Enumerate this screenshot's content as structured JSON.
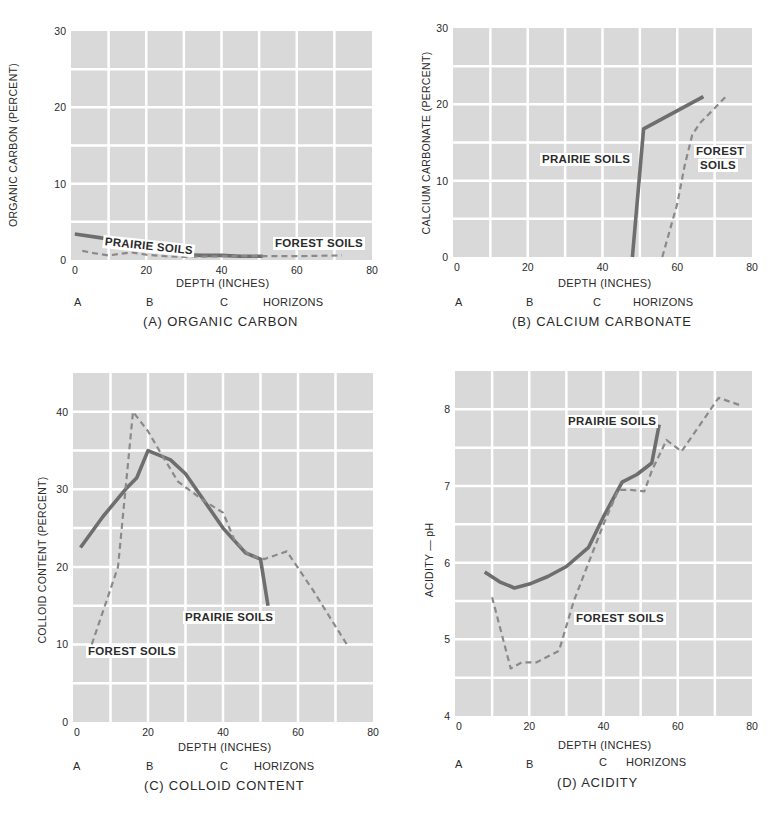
{
  "chart_data": [
    {
      "id": "A",
      "type": "line",
      "title": "(A) ORGANIC CARBON",
      "xlabel": "DEPTH  (INCHES)",
      "ylabel": "ORGANIC CARBON (PERCENT)",
      "xlim": [
        0,
        80
      ],
      "ylim": [
        0,
        30
      ],
      "xticks": [
        0,
        20,
        40,
        60,
        80
      ],
      "yticks": [
        0,
        10,
        20,
        30
      ],
      "grid": true,
      "horizons": [
        "A",
        "B",
        "C",
        "HORIZONS"
      ],
      "series": [
        {
          "name": "PRAIRIE SOILS",
          "style": "solid",
          "x": [
            1,
            8,
            15,
            17,
            20,
            25,
            30,
            35,
            40,
            45,
            50,
            51
          ],
          "y": [
            3.4,
            2.9,
            2.5,
            2.2,
            1.6,
            1.1,
            0.7,
            0.6,
            0.6,
            0.5,
            0.5,
            0.5
          ]
        },
        {
          "name": "FOREST SOILS",
          "style": "dashed",
          "x": [
            3,
            6,
            10,
            13,
            16,
            20,
            25,
            30,
            40,
            50,
            60,
            72
          ],
          "y": [
            1.2,
            0.9,
            0.6,
            0.8,
            1.0,
            0.7,
            0.5,
            0.4,
            0.5,
            0.5,
            0.5,
            0.6
          ]
        }
      ],
      "labels": [
        {
          "text": "PRAIRIE SOILS",
          "series": "PRAIRIE SOILS"
        },
        {
          "text": "FOREST SOILS",
          "series": "FOREST SOILS"
        }
      ]
    },
    {
      "id": "B",
      "type": "line",
      "title": "(B) CALCIUM CARBONATE",
      "xlabel": "DEPTH  (INCHES)",
      "ylabel": "CALCIUM CARBONATE (PERCENT)",
      "xlim": [
        0,
        80
      ],
      "ylim": [
        0,
        30
      ],
      "xticks": [
        0,
        20,
        40,
        60,
        80
      ],
      "yticks": [
        0,
        10,
        20,
        30
      ],
      "grid": true,
      "horizons": [
        "A",
        "B",
        "C",
        "HORIZONS"
      ],
      "series": [
        {
          "name": "PRAIRIE SOILS",
          "style": "solid",
          "x": [
            48,
            51,
            67
          ],
          "y": [
            0,
            16.8,
            21
          ]
        },
        {
          "name": "FOREST SOILS",
          "style": "dashed",
          "x": [
            56,
            60,
            62,
            64,
            66,
            73
          ],
          "y": [
            0,
            7,
            12,
            16,
            17.5,
            21
          ]
        }
      ],
      "labels": [
        {
          "text": "PRAIRIE SOILS",
          "series": "PRAIRIE SOILS"
        },
        {
          "text": "FOREST\nSOILS",
          "series": "FOREST SOILS"
        }
      ]
    },
    {
      "id": "C",
      "type": "line",
      "title": "(C) COLLOID CONTENT",
      "xlabel": "DEPTH  (INCHES)",
      "ylabel": "COLLOID CONTENT (PERCENT)",
      "xlim": [
        0,
        80
      ],
      "ylim": [
        0,
        45
      ],
      "xticks": [
        0,
        20,
        40,
        60,
        80
      ],
      "yticks": [
        0,
        10,
        20,
        30,
        40
      ],
      "grid": true,
      "horizons": [
        "A",
        "B",
        "C",
        "HORIZONS"
      ],
      "series": [
        {
          "name": "PRAIRIE SOILS",
          "style": "solid",
          "x": [
            2,
            8,
            14,
            17,
            20,
            26,
            30,
            35,
            40,
            46,
            50,
            52
          ],
          "y": [
            22.5,
            26.5,
            30,
            31.5,
            35,
            33.8,
            32,
            28.5,
            25,
            21.8,
            21,
            15
          ]
        },
        {
          "name": "FOREST SOILS",
          "style": "dashed",
          "x": [
            5,
            12,
            14,
            16,
            20,
            23,
            28,
            35,
            40,
            43,
            47,
            51,
            57,
            64,
            73
          ],
          "y": [
            10,
            20,
            30,
            40,
            37.5,
            35,
            31,
            28.5,
            27,
            23.5,
            21.5,
            21,
            22,
            17,
            10
          ]
        }
      ],
      "labels": [
        {
          "text": "PRAIRIE SOILS",
          "series": "PRAIRIE SOILS"
        },
        {
          "text": "FOREST SOILS",
          "series": "FOREST SOILS"
        }
      ]
    },
    {
      "id": "D",
      "type": "line",
      "title": "(D) ACIDITY",
      "xlabel": "DEPTH  (INCHES)",
      "ylabel": "ACIDITY — pH",
      "xlim": [
        0,
        80
      ],
      "ylim": [
        4,
        8.5
      ],
      "xticks": [
        0,
        20,
        40,
        60,
        80
      ],
      "yticks": [
        4,
        5,
        6,
        7,
        8
      ],
      "grid": true,
      "horizons": [
        "A",
        "B",
        "C",
        "HORIZONS"
      ],
      "series": [
        {
          "name": "PRAIRIE SOILS",
          "style": "solid",
          "x": [
            8,
            12,
            16,
            20,
            25,
            30,
            36,
            40,
            45,
            49,
            53,
            55
          ],
          "y": [
            5.88,
            5.75,
            5.67,
            5.72,
            5.82,
            5.95,
            6.2,
            6.6,
            7.05,
            7.15,
            7.3,
            7.8
          ]
        },
        {
          "name": "FOREST SOILS",
          "style": "dashed",
          "x": [
            10,
            15,
            18,
            22,
            28,
            32,
            36,
            40,
            44,
            47,
            51,
            53,
            57,
            61,
            71,
            77
          ],
          "y": [
            5.55,
            4.62,
            4.7,
            4.7,
            4.85,
            5.5,
            6.0,
            6.5,
            6.95,
            6.95,
            6.93,
            7.2,
            7.6,
            7.45,
            8.15,
            8.05
          ]
        }
      ],
      "labels": [
        {
          "text": "PRAIRIE SOILS",
          "series": "PRAIRIE SOILS"
        },
        {
          "text": "FOREST SOILS",
          "series": "FOREST SOILS"
        }
      ]
    }
  ],
  "panels": {
    "a": {
      "title": "(A) ORGANIC CARBON",
      "xlabel": "DEPTH  (INCHES)",
      "ylabel": "ORGANIC CARBON (PERCENT)",
      "horizon_a": "A",
      "horizon_b": "B",
      "horizon_c": "C",
      "horizons": "HORIZONS",
      "label_prairie": "PRAIRIE SOILS",
      "label_forest": "FOREST SOILS"
    },
    "b": {
      "title": "(B) CALCIUM CARBONATE",
      "xlabel": "DEPTH  (INCHES)",
      "ylabel": "CALCIUM CARBONATE (PERCENT)",
      "horizon_a": "A",
      "horizon_b": "B",
      "horizon_c": "C",
      "horizons": "HORIZONS",
      "label_prairie": "PRAIRIE SOILS",
      "label_forest_1": "FOREST",
      "label_forest_2": "SOILS"
    },
    "c": {
      "title": "(C) COLLOID CONTENT",
      "xlabel": "DEPTH  (INCHES)",
      "ylabel": "COLLOID CONTENT (PERCENT)",
      "horizon_a": "A",
      "horizon_b": "B",
      "horizon_c": "C",
      "horizons": "HORIZONS",
      "label_prairie": "PRAIRIE SOILS",
      "label_forest": "FOREST SOILS"
    },
    "d": {
      "title": "(D) ACIDITY",
      "xlabel": "DEPTH  (INCHES)",
      "ylabel": "ACIDITY — pH",
      "horizon_a": "A",
      "horizon_b": "B",
      "horizon_c": "C",
      "horizons": "HORIZONS",
      "label_prairie": "PRAIRIE SOILS",
      "label_forest": "FOREST SOILS"
    }
  },
  "colors": {
    "plot_bg": "#d9d9d9",
    "grid": "#ffffff",
    "prairie_line": "#6e6e6e",
    "forest_line": "#8a8a8a",
    "text": "#2a2a2a"
  }
}
